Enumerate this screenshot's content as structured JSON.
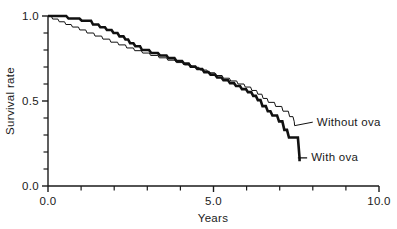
{
  "chart_data": {
    "type": "line",
    "title": "",
    "subtitle": "",
    "xlabel": "Years",
    "ylabel": "Survival rate",
    "xlim": [
      0.0,
      10.0
    ],
    "ylim": [
      0.0,
      1.0
    ],
    "grid": false,
    "legend_position": "inline-right",
    "x_ticks_major": [
      "0.0",
      "5.0",
      "10.0"
    ],
    "x_ticks_major_values": [
      0.0,
      5.0,
      10.0
    ],
    "x_ticks_minor_values": [
      1,
      2,
      3,
      4,
      6,
      7,
      8,
      9
    ],
    "y_ticks_major": [
      "0.0",
      "0.5",
      "1.0"
    ],
    "y_ticks_major_values": [
      0.0,
      0.5,
      1.0
    ],
    "y_ticks_minor_values": [
      0.1,
      0.2,
      0.3,
      0.4,
      0.6,
      0.7,
      0.8,
      0.9
    ],
    "annotations": [
      "Without ova",
      "With ova"
    ],
    "series": [
      {
        "name": "With ova",
        "style": "thick-step",
        "label": "With ova",
        "label_x": 7.95,
        "label_y": 0.145,
        "leader_from_x": 7.55,
        "leader_from_y": 0.165,
        "step_points": [
          [
            0.0,
            1.0
          ],
          [
            0.55,
            1.0
          ],
          [
            0.62,
            0.985
          ],
          [
            0.95,
            0.985
          ],
          [
            1.02,
            0.972
          ],
          [
            1.3,
            0.972
          ],
          [
            1.36,
            0.95
          ],
          [
            1.52,
            0.95
          ],
          [
            1.58,
            0.934
          ],
          [
            1.72,
            0.934
          ],
          [
            1.78,
            0.918
          ],
          [
            1.92,
            0.918
          ],
          [
            1.98,
            0.9
          ],
          [
            2.1,
            0.9
          ],
          [
            2.16,
            0.88
          ],
          [
            2.28,
            0.88
          ],
          [
            2.34,
            0.862
          ],
          [
            2.42,
            0.862
          ],
          [
            2.48,
            0.84
          ],
          [
            2.58,
            0.84
          ],
          [
            2.64,
            0.822
          ],
          [
            2.78,
            0.822
          ],
          [
            2.84,
            0.8
          ],
          [
            3.05,
            0.8
          ],
          [
            3.12,
            0.782
          ],
          [
            3.32,
            0.782
          ],
          [
            3.38,
            0.768
          ],
          [
            3.58,
            0.768
          ],
          [
            3.64,
            0.752
          ],
          [
            3.82,
            0.752
          ],
          [
            3.88,
            0.735
          ],
          [
            4.05,
            0.735
          ],
          [
            4.11,
            0.72
          ],
          [
            4.25,
            0.72
          ],
          [
            4.31,
            0.702
          ],
          [
            4.45,
            0.702
          ],
          [
            4.51,
            0.688
          ],
          [
            4.66,
            0.688
          ],
          [
            4.72,
            0.67
          ],
          [
            4.85,
            0.67
          ],
          [
            4.91,
            0.655
          ],
          [
            5.05,
            0.655
          ],
          [
            5.11,
            0.638
          ],
          [
            5.24,
            0.638
          ],
          [
            5.3,
            0.622
          ],
          [
            5.44,
            0.622
          ],
          [
            5.5,
            0.605
          ],
          [
            5.62,
            0.605
          ],
          [
            5.68,
            0.588
          ],
          [
            5.8,
            0.588
          ],
          [
            5.86,
            0.57
          ],
          [
            5.98,
            0.57
          ],
          [
            6.04,
            0.552
          ],
          [
            6.14,
            0.552
          ],
          [
            6.2,
            0.53
          ],
          [
            6.28,
            0.53
          ],
          [
            6.34,
            0.505
          ],
          [
            6.42,
            0.505
          ],
          [
            6.48,
            0.47
          ],
          [
            6.58,
            0.47
          ],
          [
            6.64,
            0.44
          ],
          [
            6.72,
            0.44
          ],
          [
            6.78,
            0.415
          ],
          [
            6.92,
            0.415
          ],
          [
            6.98,
            0.38
          ],
          [
            7.08,
            0.38
          ],
          [
            7.14,
            0.33
          ],
          [
            7.22,
            0.33
          ],
          [
            7.28,
            0.285
          ],
          [
            7.55,
            0.285
          ],
          [
            7.6,
            0.165
          ],
          [
            7.6,
            0.145
          ]
        ]
      },
      {
        "name": "Without ova",
        "style": "thin-step",
        "label": "Without ova",
        "label_x": 8.12,
        "label_y": 0.355,
        "leader_from_x": 7.45,
        "leader_from_y": 0.355,
        "step_points": [
          [
            0.0,
            1.0
          ],
          [
            0.1,
            1.0
          ],
          [
            0.14,
            0.982
          ],
          [
            0.3,
            0.982
          ],
          [
            0.34,
            0.966
          ],
          [
            0.5,
            0.966
          ],
          [
            0.54,
            0.95
          ],
          [
            0.7,
            0.95
          ],
          [
            0.74,
            0.935
          ],
          [
            0.92,
            0.935
          ],
          [
            0.96,
            0.918
          ],
          [
            1.14,
            0.918
          ],
          [
            1.18,
            0.9
          ],
          [
            1.38,
            0.9
          ],
          [
            1.42,
            0.882
          ],
          [
            1.62,
            0.882
          ],
          [
            1.66,
            0.864
          ],
          [
            1.86,
            0.864
          ],
          [
            1.9,
            0.846
          ],
          [
            2.1,
            0.846
          ],
          [
            2.14,
            0.83
          ],
          [
            2.34,
            0.83
          ],
          [
            2.38,
            0.812
          ],
          [
            2.58,
            0.812
          ],
          [
            2.62,
            0.796
          ],
          [
            2.82,
            0.796
          ],
          [
            2.86,
            0.782
          ],
          [
            3.06,
            0.782
          ],
          [
            3.1,
            0.768
          ],
          [
            3.32,
            0.768
          ],
          [
            3.36,
            0.754
          ],
          [
            3.58,
            0.754
          ],
          [
            3.62,
            0.74
          ],
          [
            3.84,
            0.74
          ],
          [
            3.88,
            0.726
          ],
          [
            4.08,
            0.726
          ],
          [
            4.12,
            0.712
          ],
          [
            4.32,
            0.712
          ],
          [
            4.36,
            0.698
          ],
          [
            4.56,
            0.698
          ],
          [
            4.6,
            0.682
          ],
          [
            4.8,
            0.682
          ],
          [
            4.84,
            0.666
          ],
          [
            5.04,
            0.666
          ],
          [
            5.08,
            0.65
          ],
          [
            5.26,
            0.65
          ],
          [
            5.3,
            0.634
          ],
          [
            5.48,
            0.634
          ],
          [
            5.52,
            0.618
          ],
          [
            5.7,
            0.618
          ],
          [
            5.74,
            0.6
          ],
          [
            5.92,
            0.6
          ],
          [
            5.96,
            0.582
          ],
          [
            6.12,
            0.582
          ],
          [
            6.16,
            0.562
          ],
          [
            6.3,
            0.562
          ],
          [
            6.34,
            0.54
          ],
          [
            6.46,
            0.54
          ],
          [
            6.5,
            0.515
          ],
          [
            6.62,
            0.515
          ],
          [
            6.66,
            0.492
          ],
          [
            6.84,
            0.492
          ],
          [
            6.88,
            0.468
          ],
          [
            7.06,
            0.468
          ],
          [
            7.1,
            0.44
          ],
          [
            7.26,
            0.44
          ],
          [
            7.3,
            0.408
          ],
          [
            7.4,
            0.408
          ],
          [
            7.44,
            0.378
          ],
          [
            7.45,
            0.355
          ]
        ]
      }
    ]
  }
}
